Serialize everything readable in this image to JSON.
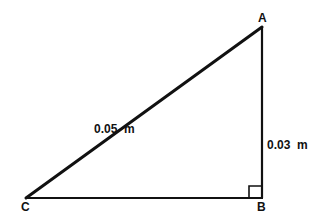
{
  "diagram": {
    "type": "right-triangle",
    "vertices": {
      "A": {
        "label": "A"
      },
      "B": {
        "label": "B"
      },
      "C": {
        "label": "C"
      }
    },
    "right_angle_at": "B",
    "sides": {
      "hypotenuse_CA": {
        "label": "0.05  m"
      },
      "leg_AB": {
        "label": "0.03  m"
      }
    },
    "colors": {
      "stroke": "#111111",
      "background": "#ffffff"
    }
  }
}
